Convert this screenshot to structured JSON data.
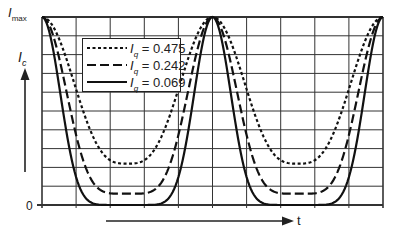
{
  "chart_data": {
    "type": "line",
    "title": "",
    "xlabel": "t",
    "ylabel": "I_c",
    "y_tick_labels": [
      "0",
      "I_max"
    ],
    "ylim": [
      0,
      1
    ],
    "grid": true,
    "grid_columns": 10,
    "grid_rows": 10,
    "legend_position": "upper-left inside",
    "x_description": "time, two full periods; peaks at t=0, 0.5, 1.0 (normalized), minima at t=0.25, 0.75",
    "x": [
      0,
      0.05,
      0.1,
      0.15,
      0.2,
      0.25,
      0.3,
      0.35,
      0.4,
      0.45,
      0.5,
      0.55,
      0.6,
      0.65,
      0.7,
      0.75,
      0.8,
      0.85,
      0.9,
      0.95,
      1.0
    ],
    "series": [
      {
        "name": "I_q = 0.475",
        "style": "dotted",
        "minimum": 0.22,
        "values": [
          1.0,
          0.86,
          0.58,
          0.35,
          0.24,
          0.22,
          0.24,
          0.35,
          0.58,
          0.86,
          1.0,
          0.86,
          0.58,
          0.35,
          0.24,
          0.22,
          0.24,
          0.35,
          0.58,
          0.86,
          1.0
        ]
      },
      {
        "name": "I_q = 0.242",
        "style": "dashed",
        "minimum": 0.06,
        "values": [
          1.0,
          0.8,
          0.42,
          0.16,
          0.07,
          0.06,
          0.07,
          0.16,
          0.42,
          0.8,
          1.0,
          0.8,
          0.42,
          0.16,
          0.07,
          0.06,
          0.07,
          0.16,
          0.42,
          0.8,
          1.0
        ]
      },
      {
        "name": "I_q = 0.069",
        "style": "solid",
        "minimum": 0.0,
        "values": [
          1.0,
          0.74,
          0.26,
          0.04,
          0.005,
          0.0,
          0.005,
          0.04,
          0.26,
          0.74,
          1.0,
          0.74,
          0.26,
          0.04,
          0.005,
          0.0,
          0.005,
          0.04,
          0.26,
          0.74,
          1.0
        ]
      }
    ]
  },
  "axis": {
    "y_top_label": "I",
    "y_top_sub": "max",
    "y_zero_label": "0",
    "y_name": "I",
    "y_name_sub": "c",
    "x_name": "t"
  },
  "legend": [
    {
      "var": "I",
      "sub": "q",
      "value": "= 0.475",
      "style": "dotted"
    },
    {
      "var": "I",
      "sub": "q",
      "value": "= 0.242",
      "style": "dashed"
    },
    {
      "var": "I",
      "sub": "q",
      "value": "= 0.069",
      "style": "solid"
    }
  ]
}
